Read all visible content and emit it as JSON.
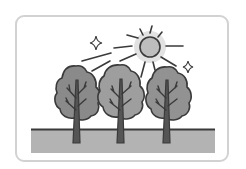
{
  "illustration": {
    "subject": "three trees under the sun",
    "elements": [
      "sun",
      "sun-rays",
      "sparkle-left",
      "sparkle-right",
      "tree-left",
      "tree-middle",
      "tree-right",
      "ground"
    ],
    "colors": {
      "card_border": "#d2d2d2",
      "outline": "#3a3a3a",
      "sun_fill": "#bdbdbd",
      "sun_halo": "#e2e2e2",
      "tree_left": "#8a8a8a",
      "tree_middle": "#9e9e9e",
      "tree_right": "#929292",
      "trunk": "#555555",
      "ground": "#b3b3b3"
    }
  }
}
